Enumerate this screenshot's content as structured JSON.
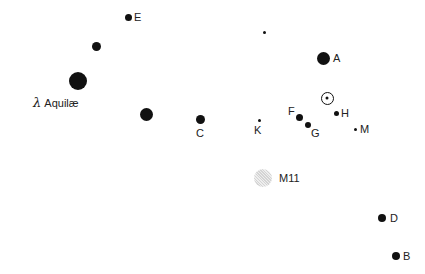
{
  "chart": {
    "title": "",
    "background": "#ffffff",
    "star_color": "#111111"
  },
  "stars": [
    {
      "id": "E",
      "label": "E",
      "x": 128,
      "y": 17,
      "r": 3.5,
      "label_x": 134,
      "label_y": 11
    },
    {
      "id": "unlabeled-1",
      "label": "",
      "x": 96,
      "y": 46,
      "r": 4.5
    },
    {
      "id": "lambda-aquilae",
      "label": "Aquilæ",
      "greek": "λ",
      "x": 78,
      "y": 81,
      "r": 9,
      "label_x": 33,
      "label_y": 97
    },
    {
      "id": "unlabeled-2",
      "label": "",
      "x": 146,
      "y": 114,
      "r": 6.5
    },
    {
      "id": "C",
      "label": "C",
      "x": 200,
      "y": 119,
      "r": 4.5,
      "label_x": 196,
      "label_y": 127
    },
    {
      "id": "unlabeled-3",
      "label": "",
      "x": 264,
      "y": 32,
      "r": 1.5
    },
    {
      "id": "A",
      "label": "A",
      "x": 323,
      "y": 58,
      "r": 6.5,
      "label_x": 333,
      "label_y": 52
    },
    {
      "id": "F",
      "label": "F",
      "x": 299,
      "y": 117,
      "r": 3.5,
      "label_x": 288,
      "label_y": 105
    },
    {
      "id": "G",
      "label": "G",
      "x": 308,
      "y": 125,
      "r": 3,
      "label_x": 311,
      "label_y": 127
    },
    {
      "id": "H",
      "label": "H",
      "x": 336,
      "y": 113,
      "r": 2.5,
      "label_x": 341,
      "label_y": 107
    },
    {
      "id": "K",
      "label": "K",
      "x": 259,
      "y": 120,
      "r": 1.5,
      "label_x": 254,
      "label_y": 124
    },
    {
      "id": "M",
      "label": "M",
      "x": 355,
      "y": 129,
      "r": 1.5,
      "label_x": 360,
      "label_y": 123
    },
    {
      "id": "D",
      "label": "D",
      "x": 382,
      "y": 218,
      "r": 4,
      "label_x": 390,
      "label_y": 212
    },
    {
      "id": "B",
      "label": "B",
      "x": 396,
      "y": 256,
      "r": 4,
      "label_x": 403,
      "label_y": 250
    }
  ],
  "sun": {
    "symbol": "⊙",
    "x": 327,
    "y": 98,
    "r": 6.5
  },
  "cluster": {
    "id": "M11",
    "label": "M11",
    "x": 263,
    "y": 178,
    "r": 9,
    "label_x": 279,
    "label_y": 172
  }
}
